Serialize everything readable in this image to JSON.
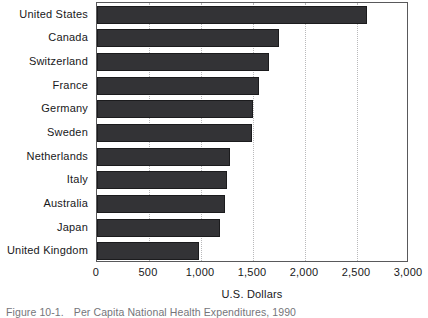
{
  "figure": {
    "caption_label": "Figure 10-1.",
    "caption_text": "Per Capita National Health Expenditures, 1990"
  },
  "chart_data": {
    "type": "bar",
    "orientation": "horizontal",
    "title": "",
    "subtitle": "",
    "xlabel": "U.S. Dollars",
    "ylabel": "",
    "categories": [
      "United States",
      "Canada",
      "Switzerland",
      "France",
      "Germany",
      "Sweden",
      "Netherlands",
      "Italy",
      "Australia",
      "Japan",
      "United Kingdom"
    ],
    "values": [
      2600,
      1750,
      1650,
      1560,
      1500,
      1490,
      1280,
      1250,
      1230,
      1180,
      980
    ],
    "xlim": [
      0,
      3000
    ],
    "xticks": [
      0,
      500,
      1000,
      1500,
      2000,
      2500,
      3000
    ],
    "xtick_labels": [
      "0",
      "500",
      "1,000",
      "1,500",
      "2,000",
      "2,500",
      "3,000"
    ],
    "grid": "vertical-dotted",
    "legend": "none",
    "bar_color": "#333336",
    "axis_color": "#59595b",
    "grid_color": "#b9b9bb"
  }
}
